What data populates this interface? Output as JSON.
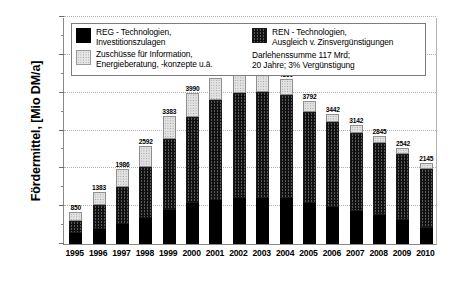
{
  "chart_data": {
    "type": "bar",
    "stacked": true,
    "title": "",
    "xlabel": "",
    "ylabel": "Fördermittel, [Mio DM/a]",
    "ylim": [
      0,
      6000
    ],
    "ytick_step": 1000,
    "yticks": [
      "0",
      "1000",
      "2000",
      "3000",
      "4000",
      "5000",
      "6000"
    ],
    "grid": true,
    "grid_axis": "y",
    "legend_position": "top-inside",
    "categories": [
      "1995",
      "1996",
      "1997",
      "1998",
      "1999",
      "2000",
      "2001",
      "2002",
      "2003",
      "2004",
      "2005",
      "2006",
      "2007",
      "2008",
      "2009",
      "2010"
    ],
    "totals": [
      850,
      1383,
      1986,
      2592,
      3383,
      3990,
      4385,
      4522,
      4502,
      4350,
      3792,
      3442,
      3142,
      2845,
      2542,
      2145
    ],
    "series": [
      {
        "name": "REG - Technologien, Investitionszulagen",
        "key": "reg",
        "pattern": "solid-black",
        "values": [
          280,
          390,
          520,
          700,
          900,
          1080,
          1160,
          1210,
          1220,
          1210,
          1080,
          980,
          870,
          760,
          640,
          420
        ]
      },
      {
        "name": "REN - Technologien, Ausgleich v. Zinsvergünstigungen",
        "key": "ren",
        "pattern": "dark-crosshatch",
        "values": [
          340,
          640,
          1000,
          1330,
          1880,
          2270,
          2640,
          2790,
          2790,
          2740,
          2420,
          2240,
          2070,
          1910,
          1730,
          1560
        ]
      },
      {
        "name": "Zuschüsse für Information, Energieberatung, -konzepte u.ä.",
        "key": "zuschuesse",
        "pattern": "light-dotted",
        "values": [
          230,
          353,
          466,
          562,
          603,
          640,
          585,
          522,
          492,
          400,
          292,
          222,
          202,
          175,
          172,
          165
        ]
      }
    ],
    "data_labels": [
      "850",
      "1383",
      "1986",
      "2592",
      "3383",
      "3990",
      "4385",
      "4522",
      "4502",
      "4350",
      "3792",
      "3442",
      "3142",
      "2845",
      "2542",
      "2145"
    ]
  },
  "legend": {
    "items": [
      {
        "swatch": "solid-black",
        "line1": "REG - Technologien,",
        "line2": "Investitionszulagen"
      },
      {
        "swatch": "light-dotted",
        "line1": "Zuschüsse für Information,",
        "line2": "Energieberatung, -konzepte u.ä."
      },
      {
        "swatch": "dark-crosshatch",
        "line1": "REN - Technologien,",
        "line2": "Ausgleich v. Zinsvergünstigungen"
      }
    ],
    "note": {
      "line1": "Darlehenssumme 117 Mrd;",
      "line2": "20 Jahre; 3% Vergünstigung"
    }
  },
  "colors": {
    "reg": "#000000",
    "ren": "#3a3a3a",
    "zuschuesse": "#e2e2e2",
    "axis": "#8a8a8a",
    "grid": "#b0b0b0",
    "text": "#000000",
    "background": "#ffffff"
  }
}
